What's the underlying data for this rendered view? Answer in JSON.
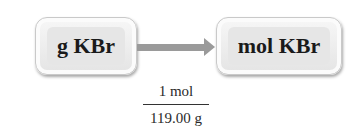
{
  "diagram": {
    "from_box": {
      "label": "g KBr"
    },
    "to_box": {
      "label": "mol KBr"
    },
    "arrow": {
      "direction": "right",
      "color": "#9a9a9a"
    },
    "conversion_factor": {
      "numerator": "1 mol",
      "denominator": "119.00 g"
    }
  }
}
